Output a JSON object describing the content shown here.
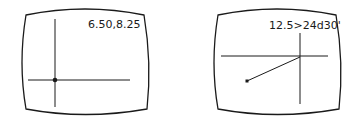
{
  "screens": [
    {
      "name": "point-screen",
      "readout": "6.50,8.25",
      "mode": "cartesian coordinates"
    },
    {
      "name": "polar-screen",
      "readout": "12.5>24d30'",
      "mode": "polar coordinates"
    }
  ],
  "colors": {
    "line": "#1a1a1a",
    "background": "#ffffff"
  }
}
